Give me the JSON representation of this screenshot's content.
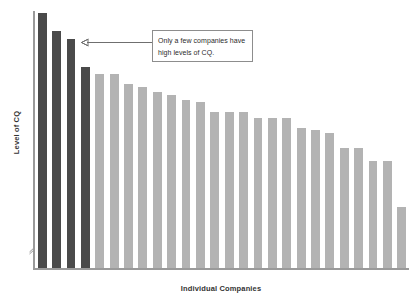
{
  "chart_data": {
    "type": "bar",
    "title": "",
    "subtitle": "",
    "xlabel": "Individual Companies",
    "ylabel": "Level of CQ",
    "grid": false,
    "legend": null,
    "legend_position": "none",
    "x_tick_labels": [],
    "y_tick_labels": [],
    "y_axis_break": true,
    "ylim": [
      0,
      100
    ],
    "categories": [
      "Company 1",
      "Company 2",
      "Company 3",
      "Company 4",
      "Company 5",
      "Company 6",
      "Company 7",
      "Company 8",
      "Company 9",
      "Company 10",
      "Company 11",
      "Company 12",
      "Company 13",
      "Company 14",
      "Company 15",
      "Company 16",
      "Company 17",
      "Company 18",
      "Company 19",
      "Company 20",
      "Company 21",
      "Company 22",
      "Company 23",
      "Company 24",
      "Company 25",
      "Company 26"
    ],
    "values": [
      100,
      93,
      90,
      79,
      76,
      76,
      72,
      71,
      69,
      68,
      66,
      65,
      61,
      61,
      61,
      59,
      59,
      59,
      55,
      54,
      53,
      47,
      47,
      42,
      42,
      24
    ],
    "bar_colors": [
      "#4a4a4a",
      "#4a4a4a",
      "#4a4a4a",
      "#4a4a4a",
      "#b3b3b3",
      "#b3b3b3",
      "#b3b3b3",
      "#b3b3b3",
      "#b3b3b3",
      "#b3b3b3",
      "#b3b3b3",
      "#b3b3b3",
      "#b3b3b3",
      "#b3b3b3",
      "#b3b3b3",
      "#b3b3b3",
      "#b3b3b3",
      "#b3b3b3",
      "#b3b3b3",
      "#b3b3b3",
      "#b3b3b3",
      "#b3b3b3",
      "#b3b3b3",
      "#b3b3b3",
      "#b3b3b3",
      "#b3b3b3"
    ],
    "highlight_color": "#4a4a4a",
    "base_color": "#b3b3b3",
    "axis_color": "#9a9a9a",
    "annotations": [
      {
        "text": "Only a few companies have high levels of CQ.",
        "points_to_bar_index": 3
      }
    ]
  },
  "annotation": {
    "line1": "Only a few companies",
    "line2": "have high levels of CQ.",
    "full": "Only a few companies have high levels of CQ."
  },
  "axes": {
    "y_title": "Level of CQ",
    "x_title": "Individual Companies"
  }
}
